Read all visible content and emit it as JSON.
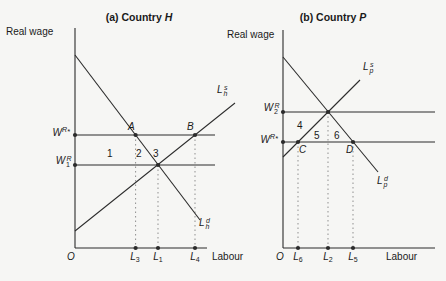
{
  "colors": {
    "line": "#2b2b2b",
    "dotted": "#8f8f8f",
    "background": "#f6f6f4",
    "text": "#1a1a1a"
  },
  "panel_a": {
    "title": {
      "prefix": "(a) Country",
      "symbol": "H"
    },
    "y_axis_label": "Real wage",
    "x_axis_label": "Labour",
    "origin": "O",
    "wage_world": {
      "base": "W",
      "sup": "R",
      "star": "*"
    },
    "wage_autarky": {
      "base": "W",
      "sub": "1",
      "sup": "R"
    },
    "supply_label": {
      "base": "L",
      "sub": "h",
      "sup": "s"
    },
    "demand_label": {
      "base": "L",
      "sub": "h",
      "sup": "d"
    },
    "point_a": "A",
    "point_b": "B",
    "region_1": "1",
    "region_2": "2",
    "region_3": "3",
    "tick_1": {
      "base": "L",
      "sub": "3"
    },
    "tick_2": {
      "base": "L",
      "sub": "1"
    },
    "tick_3": {
      "base": "L",
      "sub": "4"
    }
  },
  "panel_b": {
    "title": {
      "prefix": "(b) Country",
      "symbol": "P"
    },
    "y_axis_label": "Real wage",
    "x_axis_label": "Labour",
    "origin": "O",
    "wage_autarky": {
      "base": "W",
      "sub": "2",
      "sup": "R"
    },
    "wage_world": {
      "base": "W",
      "sup": "R",
      "star": "*"
    },
    "supply_label": {
      "base": "L",
      "sub": "p",
      "sup": "s"
    },
    "demand_label": {
      "base": "L",
      "sub": "p",
      "sup": "d"
    },
    "point_c": "C",
    "point_d": "D",
    "region_4": "4",
    "region_5": "5",
    "region_6": "6",
    "tick_1": {
      "base": "L",
      "sub": "6"
    },
    "tick_2": {
      "base": "L",
      "sub": "2"
    },
    "tick_3": {
      "base": "L",
      "sub": "5"
    }
  }
}
